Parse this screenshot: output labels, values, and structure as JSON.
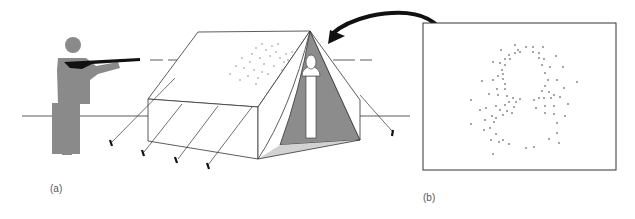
{
  "figure": {
    "panel_a": {
      "label": "(a)"
    },
    "panel_b": {
      "label": "(b)"
    },
    "colors": {
      "figure": "#8a8a8a",
      "rifle": "#111111",
      "tent_line": "#333333",
      "tent_interior_dark": "#8c8c8c",
      "tent_floor": "#d2d2d2",
      "arrow": "#111111",
      "dots": "#888888"
    },
    "elements": [
      "shooter-with-rifle",
      "tent",
      "bust-statue-inside-tent",
      "bullet-trajectory-dashed-line",
      "bullet-hole-scatter-on-tent",
      "curved-arrow",
      "back-wall-pattern-panel"
    ]
  }
}
